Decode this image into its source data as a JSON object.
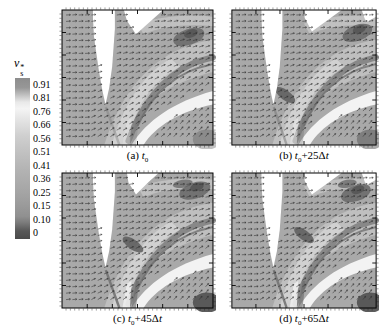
{
  "figure": {
    "colorbar": {
      "title": {
        "base": "v",
        "sup": "*",
        "sub": "s"
      },
      "ticks": [
        "0.91",
        "0.81",
        "0.76",
        "0.66",
        "0.56",
        "0.51",
        "0.41",
        "0.36",
        "0.25",
        "0.15",
        "0.10",
        "0"
      ],
      "gradient": [
        {
          "color": "#8d8d8d",
          "pos": 0
        },
        {
          "color": "#979797",
          "pos": 6
        },
        {
          "color": "#e9e9e9",
          "pos": 15
        },
        {
          "color": "#f4f4f4",
          "pos": 19
        },
        {
          "color": "#e6e6e6",
          "pos": 25
        },
        {
          "color": "#cfcfcf",
          "pos": 36
        },
        {
          "color": "#c0c0c0",
          "pos": 47
        },
        {
          "color": "#b2b2b2",
          "pos": 58
        },
        {
          "color": "#a8a8a8",
          "pos": 68
        },
        {
          "color": "#9c9c9c",
          "pos": 78
        },
        {
          "color": "#909090",
          "pos": 86
        },
        {
          "color": "#7a7a7a",
          "pos": 90
        },
        {
          "color": "#575757",
          "pos": 95
        },
        {
          "color": "#4a4a4a",
          "pos": 100
        }
      ]
    },
    "panels": [
      {
        "id": "a",
        "prefix": "(a)",
        "time_base": "t",
        "time_sub": "0",
        "delta_coeff": null
      },
      {
        "id": "b",
        "prefix": "(b)",
        "time_base": "t",
        "time_sub": "0",
        "delta_coeff": "25"
      },
      {
        "id": "c",
        "prefix": "(c)",
        "time_base": "t",
        "time_sub": "0",
        "delta_coeff": "45"
      },
      {
        "id": "d",
        "prefix": "(d)",
        "time_base": "t",
        "time_sub": "0",
        "delta_coeff": "65"
      }
    ],
    "colors": {
      "field_gray": "#a9a9a9",
      "swath_light": "#bfbfbf",
      "swath_bright": "#d4d4d4",
      "band_dark": "#7b7b7b",
      "blob_dark": "#5d5d5d",
      "mask_white": "#ffffff",
      "arrow": "#2f2f2f",
      "frame": "#000000"
    }
  },
  "chart_data": {
    "type": "heatmap",
    "subtype": "velocity-vector-field-time-sequence",
    "title": "",
    "colorbar_label": "v*_s",
    "colorbar_ticks": [
      0.91,
      0.81,
      0.76,
      0.66,
      0.56,
      0.51,
      0.41,
      0.36,
      0.25,
      0.15,
      0.1,
      0
    ],
    "colorbar_range": [
      0,
      0.91
    ],
    "legend_position": "left",
    "grid": false,
    "overlay": "velocity vector arrows over normalized-velocity grayscale map; white areas are masked blade/slot regions; dark curved band is low-velocity shear layer",
    "panels": [
      {
        "label": "(a) t0"
      },
      {
        "label": "(b) t0+25Δt"
      },
      {
        "label": "(c) t0+45Δt"
      },
      {
        "label": "(d) t0+65Δt"
      }
    ]
  }
}
